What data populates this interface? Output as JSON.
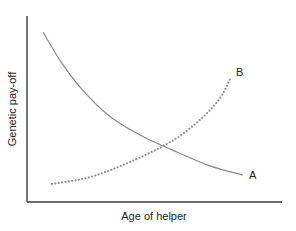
{
  "chart_data": {
    "type": "line",
    "title": "",
    "xlabel": "Age of helper",
    "ylabel": "Genetic pay-off",
    "xlim": [
      0,
      10
    ],
    "ylim": [
      0,
      10
    ],
    "grid": false,
    "ticks": false,
    "legend": "inline-labels-at-line-ends",
    "series": [
      {
        "name": "A",
        "style": "solid",
        "color": "#8a8a8a",
        "points": [
          [
            0.63,
            9.14
          ],
          [
            1.29,
            7.63
          ],
          [
            2.08,
            6.18
          ],
          [
            3.18,
            4.68
          ],
          [
            4.43,
            3.6
          ],
          [
            5.69,
            2.8
          ],
          [
            7.18,
            1.94
          ],
          [
            8.47,
            1.45
          ]
        ]
      },
      {
        "name": "B",
        "style": "dotted",
        "color": "#8e8e96",
        "points": [
          [
            0.98,
            0.97
          ],
          [
            2.47,
            1.34
          ],
          [
            4.04,
            2.15
          ],
          [
            5.69,
            3.28
          ],
          [
            6.78,
            4.41
          ],
          [
            7.57,
            5.59
          ],
          [
            8.0,
            6.72
          ]
        ]
      }
    ]
  }
}
